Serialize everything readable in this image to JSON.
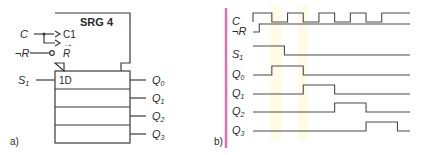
{
  "figure_a": {
    "label": "a)",
    "block_title": "SRG 4",
    "inputs": {
      "clock": {
        "name": "C",
        "pin": "C1",
        "shift_arrow": "→"
      },
      "reset": {
        "name": "¬R",
        "pin": "R"
      },
      "serial": {
        "name": "S",
        "sub": "1",
        "pin": "1D"
      }
    },
    "outputs": [
      {
        "name": "Q",
        "sub": "0"
      },
      {
        "name": "Q",
        "sub": "1"
      },
      {
        "name": "Q",
        "sub": "2"
      },
      {
        "name": "Q",
        "sub": "3"
      }
    ]
  },
  "figure_b": {
    "label": "b)",
    "signals": [
      {
        "name": "C",
        "sub": "",
        "transitions": [
          0,
          0.12,
          0.22,
          0.32,
          0.42,
          0.52,
          0.62,
          0.72,
          0.82
        ],
        "initial": 0,
        "kind": "clock"
      },
      {
        "name": "¬R",
        "sub": "",
        "transitions": [
          0.04
        ],
        "initial": 0
      },
      {
        "name": "S",
        "sub": "1",
        "transitions": [
          0.2
        ],
        "initial": 1
      },
      {
        "name": "Q",
        "sub": "0",
        "transitions": [
          0.12,
          0.32
        ],
        "initial": 0
      },
      {
        "name": "Q",
        "sub": "1",
        "transitions": [
          0.32,
          0.52
        ],
        "initial": 0
      },
      {
        "name": "Q",
        "sub": "2",
        "transitions": [
          0.52,
          0.72
        ],
        "initial": 0
      },
      {
        "name": "Q",
        "sub": "3",
        "transitions": [
          0.72,
          0.92
        ],
        "initial": 0
      }
    ]
  },
  "colors": {
    "line": "#3a3a3a",
    "margin_mark": "#e070b0",
    "highlight": "#fffbe0"
  }
}
